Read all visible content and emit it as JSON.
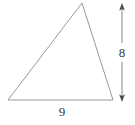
{
  "figure": {
    "type": "geometry-diagram",
    "shape": "triangle",
    "background_color": "#ffffff",
    "stroke_color": "#8c8c8c",
    "label_color": "#3a3a3a",
    "triangle": {
      "name": "scalene-triangle",
      "vertices": [
        {
          "name": "apex",
          "x": 82,
          "y": 3
        },
        {
          "name": "bottom-right",
          "x": 113,
          "y": 100
        },
        {
          "name": "bottom-left",
          "x": 8,
          "y": 100
        }
      ]
    },
    "dimensions": [
      {
        "name": "height",
        "label": "8",
        "orientation": "vertical",
        "arrow_style": "double-headed",
        "x": 122,
        "y_start": 4,
        "y_end": 101
      },
      {
        "name": "base",
        "label": "9",
        "orientation": "horizontal",
        "arrow_style": "none",
        "x": 62,
        "y": 112
      }
    ]
  },
  "chart_data": {
    "type": "diagram",
    "title": "",
    "shape": "triangle",
    "measurements": [
      {
        "label": "8",
        "role": "height",
        "value": 8
      },
      {
        "label": "9",
        "role": "base",
        "value": 9
      }
    ],
    "annotations": [
      "8",
      "9"
    ]
  }
}
